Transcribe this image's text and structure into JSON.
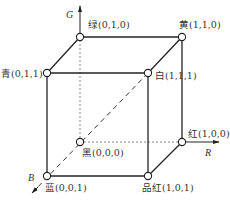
{
  "axes": {
    "G": {
      "label": "G"
    },
    "R": {
      "label": "R"
    },
    "B": {
      "label": "B"
    }
  },
  "vertices": {
    "green": {
      "name": "绿",
      "coords": "(0,1,0)",
      "text": "绿(0,1,0)"
    },
    "yellow": {
      "name": "黄",
      "coords": "(1,1,0)",
      "text": "黄(1,1,0)"
    },
    "cyan": {
      "name": "青",
      "coords": "(0,1,1)",
      "text": "青(0,1,1)"
    },
    "white": {
      "name": "白",
      "coords": "(1,1,1)",
      "text": "白(1,1,1)"
    },
    "black": {
      "name": "黑",
      "coords": "(0,0,0)",
      "text": "黑(0,0,0)"
    },
    "red": {
      "name": "红",
      "coords": "(1,0,0)",
      "text": "红(1,0,0)"
    },
    "blue": {
      "name": "蓝",
      "coords": "(0,0,1)",
      "text": "蓝(0,0,1)"
    },
    "magenta": {
      "name": "品红",
      "coords": "(1,0,1)",
      "text": "品红(1,0,1)"
    }
  },
  "colors": {
    "line": "#222222",
    "text": "#333333",
    "background": "#ffffff"
  }
}
